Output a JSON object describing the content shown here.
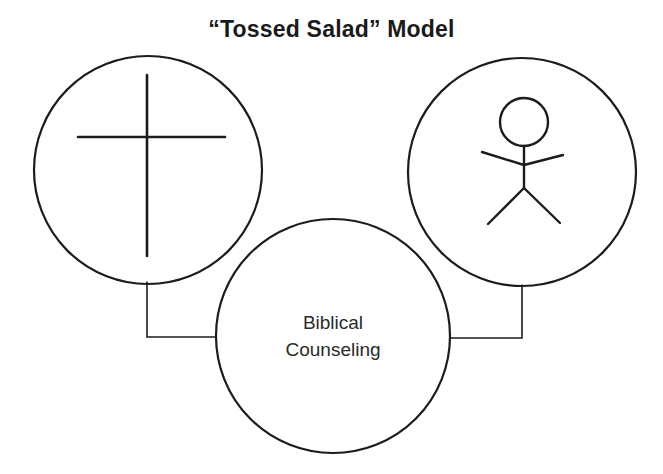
{
  "title": "“Tossed Salad” Model",
  "nodes": [
    {
      "id": "left",
      "icon": "cross-icon",
      "label": ""
    },
    {
      "id": "right",
      "icon": "stick-figure-icon",
      "label": ""
    },
    {
      "id": "center",
      "icon": "",
      "label_line1": "Biblical",
      "label_line2": "Counseling"
    }
  ],
  "edges": [
    {
      "from": "left",
      "to": "center"
    },
    {
      "from": "right",
      "to": "center"
    }
  ],
  "colors": {
    "stroke": "#1c1c1c",
    "background": "#ffffff"
  }
}
